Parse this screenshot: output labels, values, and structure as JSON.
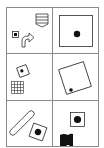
{
  "puzzle": {
    "layout": "3 rows x 2 columns",
    "line_color": "#888888",
    "ink_color": "#111111",
    "cells": [
      {
        "row": 1,
        "col": 1,
        "shapes": [
          "striped-shield",
          "small-square-with-dot",
          "curved-arrow"
        ]
      },
      {
        "row": 1,
        "col": 2,
        "shapes": [
          "large-square-with-center-dot"
        ]
      },
      {
        "row": 2,
        "col": 1,
        "shapes": [
          "tilted-square-with-dot",
          "grid-square"
        ]
      },
      {
        "row": 2,
        "col": 2,
        "shapes": [
          "large-tilted-square-with-corner-dot"
        ]
      },
      {
        "row": 3,
        "col": 1,
        "shapes": [
          "rounded-capsule",
          "tilted-square-with-large-dot"
        ]
      },
      {
        "row": 3,
        "col": 2,
        "shapes": [
          "square-with-large-dot",
          "black-flag"
        ]
      }
    ]
  }
}
